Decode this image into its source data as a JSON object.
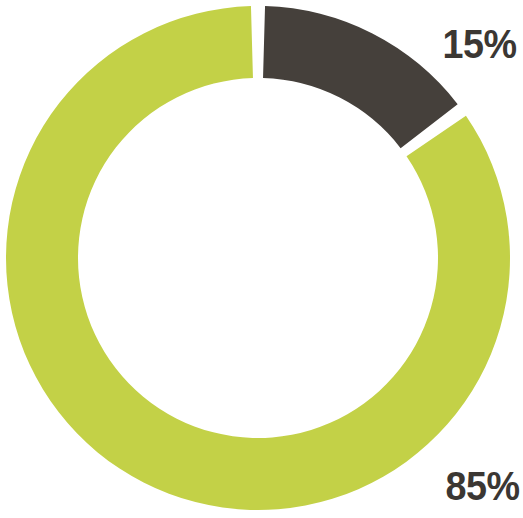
{
  "chart_data": {
    "type": "pie",
    "variant": "donut",
    "title": "",
    "subtitle": "",
    "xlabel": "",
    "ylabel": "",
    "legend": "none",
    "grid": false,
    "units": "percent",
    "total": 100,
    "categories": [
      "Dark segment",
      "Green segment"
    ],
    "values": [
      15,
      85
    ],
    "labels": [
      "15%",
      "85%"
    ],
    "colors": [
      "#45403b",
      "#c3d147"
    ],
    "slices": [
      {
        "name": "Dark segment",
        "value": 15,
        "label": "15%",
        "color": "#45403b",
        "start_angle_deg": 0,
        "end_angle_deg": 54,
        "label_position": "outside-top-right"
      },
      {
        "name": "Green segment",
        "value": 85,
        "label": "85%",
        "color": "#c3d147",
        "start_angle_deg": 54,
        "end_angle_deg": 360,
        "label_position": "outside-bottom-right"
      }
    ],
    "geometry": {
      "center_x": 258,
      "center_y": 258,
      "outer_radius": 252,
      "inner_radius": 180,
      "ring_thickness": 72,
      "start_angle_deg": 0,
      "gap_deg": 3.2,
      "direction": "clockwise"
    }
  },
  "labels": {
    "dark_pct": "15%",
    "green_pct": "85%"
  },
  "colors": {
    "dark": "#45403b",
    "green": "#c3d147",
    "background": "#ffffff",
    "label_text": "#3b3733"
  }
}
